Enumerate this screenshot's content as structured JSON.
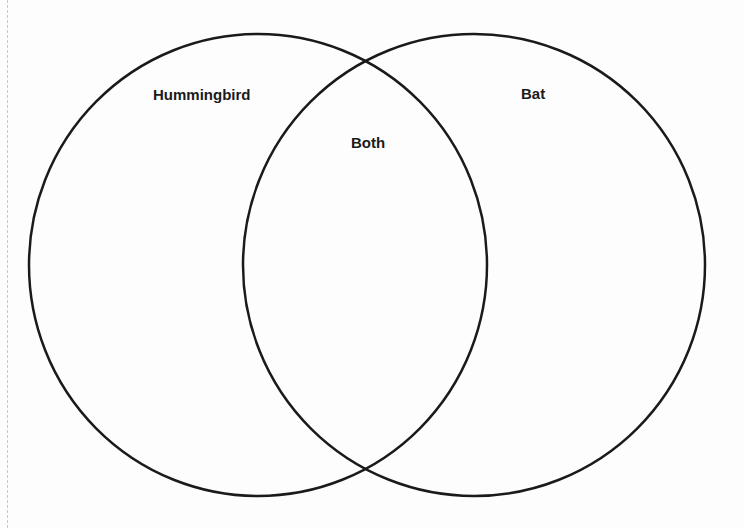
{
  "diagram": {
    "type": "venn",
    "sets": [
      {
        "id": "left",
        "label": "Hummingbird"
      },
      {
        "id": "right",
        "label": "Bat"
      }
    ],
    "intersection": {
      "label": "Both"
    },
    "stroke_color": "#1a1a1a",
    "background": "#fdfdfd"
  }
}
